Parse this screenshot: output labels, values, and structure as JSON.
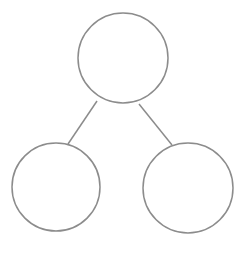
{
  "diagram": {
    "type": "tree",
    "stroke_color": "#8c8c8c",
    "fill_color": "#ffffff",
    "stroke_width": 1.5,
    "nodes": [
      {
        "id": "root",
        "cx": 123,
        "cy": 58,
        "r": 45,
        "label": ""
      },
      {
        "id": "left-child",
        "cx": 56,
        "cy": 187,
        "r": 44,
        "label": ""
      },
      {
        "id": "right-child",
        "cx": 188,
        "cy": 188,
        "r": 45,
        "label": ""
      }
    ],
    "edges": [
      {
        "from": "root",
        "to": "left-child",
        "x1": 97,
        "y1": 101,
        "x2": 68,
        "y2": 144
      },
      {
        "from": "root",
        "to": "right-child",
        "x1": 139,
        "y1": 104,
        "x2": 172,
        "y2": 145
      }
    ]
  }
}
